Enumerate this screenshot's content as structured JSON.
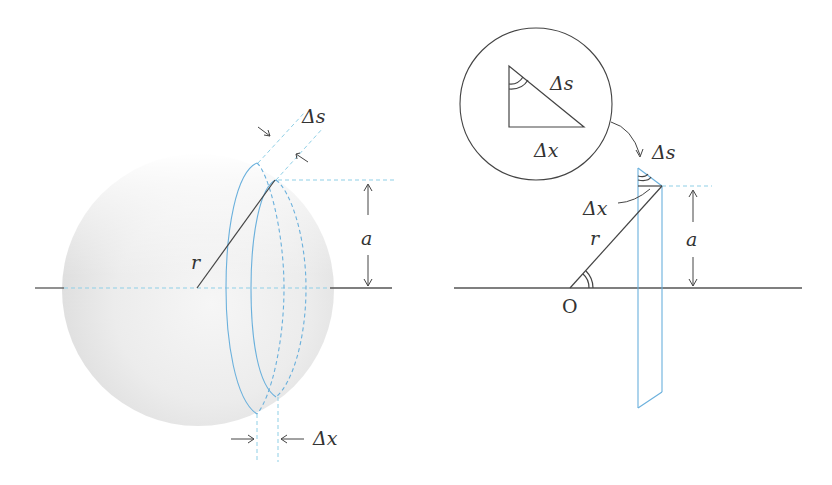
{
  "figure": {
    "left_panel": {
      "name": "sphere-slice-view",
      "labels": {
        "delta_s": "Δs",
        "delta_x": "Δx",
        "radius": "r",
        "height": "a"
      }
    },
    "right_panel": {
      "name": "cross-section-view",
      "inset": {
        "delta_s": "Δs",
        "delta_x": "Δx"
      },
      "labels": {
        "delta_s": "Δs",
        "delta_x": "Δx",
        "radius": "r",
        "height": "a",
        "origin": "O"
      }
    },
    "colors": {
      "guide_blue": "#6ab0dc",
      "dashed_blue": "#8fcfe6",
      "ink": "#444444",
      "sphere_shade": "#e6e6e6"
    }
  }
}
